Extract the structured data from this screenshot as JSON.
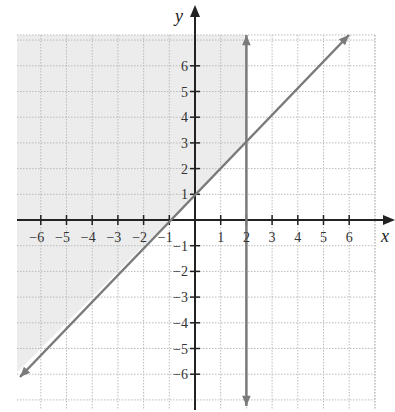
{
  "chart_data": {
    "type": "line",
    "title": "",
    "xlabel": "x",
    "ylabel": "y",
    "xlim": [
      -7,
      7
    ],
    "ylim": [
      -7,
      7
    ],
    "grid": true,
    "x_ticks": [
      "-6",
      "-5",
      "-4",
      "-3",
      "-2",
      "-1",
      "1",
      "2",
      "3",
      "4",
      "5",
      "6"
    ],
    "y_ticks": [
      "6",
      "5",
      "4",
      "3",
      "2",
      "1",
      "-1",
      "-2",
      "-3",
      "-4",
      "-5",
      "-6"
    ],
    "series": [
      {
        "name": "y = x + 1",
        "kind": "line",
        "points": [
          [
            -7,
            -6
          ],
          [
            6,
            7
          ]
        ],
        "color": "#7a7a7a"
      },
      {
        "name": "x = 2",
        "kind": "vertical-line",
        "points": [
          [
            2,
            -7
          ],
          [
            2,
            7
          ]
        ],
        "color": "#7a7a7a"
      }
    ],
    "shaded_region": {
      "description": "y >= x + 1 and x <= 2",
      "color": "#ececec"
    }
  },
  "colors": {
    "axis": "#222222",
    "grid": "#bbbbbb",
    "line": "#7a7a7a",
    "shade": "#ececec"
  }
}
